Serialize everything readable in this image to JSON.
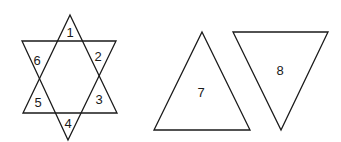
{
  "diagram": {
    "star": {
      "up_triangle": [
        [
          70,
          15
        ],
        [
          117,
          113
        ],
        [
          23,
          113
        ]
      ],
      "down_triangle": [
        [
          22,
          41
        ],
        [
          116,
          41
        ],
        [
          68,
          140
        ]
      ],
      "region_labels": [
        {
          "text": "1",
          "x": 70,
          "y": 32
        },
        {
          "text": "2",
          "x": 98,
          "y": 56
        },
        {
          "text": "3",
          "x": 99,
          "y": 99
        },
        {
          "text": "4",
          "x": 68,
          "y": 123
        },
        {
          "text": "5",
          "x": 38,
          "y": 102
        },
        {
          "text": "6",
          "x": 37,
          "y": 60
        }
      ]
    },
    "triangle_7": {
      "points": [
        [
          202,
          32
        ],
        [
          250,
          130
        ],
        [
          154,
          130
        ]
      ],
      "label": {
        "text": "7",
        "x": 201,
        "y": 92
      }
    },
    "triangle_8": {
      "points": [
        [
          233,
          32
        ],
        [
          328,
          32
        ],
        [
          281,
          130
        ]
      ],
      "label": {
        "text": "8",
        "x": 280,
        "y": 70
      }
    },
    "stroke_color": "#1a1a1a"
  }
}
